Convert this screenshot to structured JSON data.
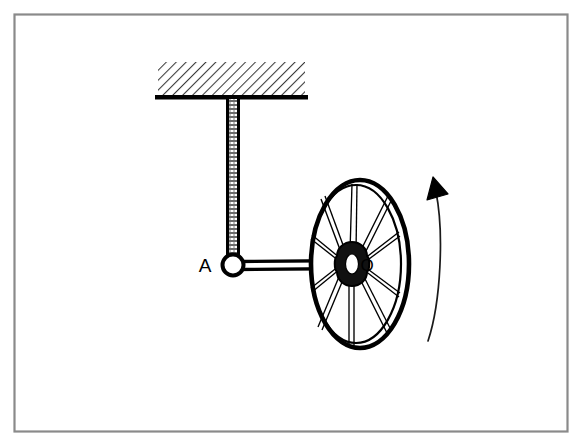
{
  "figure": {
    "background_color": "#ffffff",
    "ink_color": "#000000",
    "frame_color": "#8a8a8a"
  },
  "labels": {
    "joint_a": "A",
    "wheel_center_o": "O"
  },
  "frame": {
    "x": 14,
    "y": 14,
    "width": 554,
    "height": 418
  },
  "ceiling": {
    "name": "hatched-ceiling-support",
    "x": 158,
    "y": 62,
    "width": 147,
    "height": 34,
    "hatch_angle_deg": 45,
    "baseline_y": 97,
    "baseline_x": 155,
    "baseline_width": 153,
    "baseline_thickness": 4
  },
  "vertical_rod": {
    "name": "vertical-hanger-rod",
    "x": 226,
    "y_top": 98,
    "y_bottom": 260,
    "width": 13
  },
  "joint_a": {
    "name": "pin-joint-a",
    "cx": 233,
    "cy": 265,
    "radius": 10,
    "stroke_width": 4,
    "label_x": 205,
    "label_y": 271,
    "label_font_size": 19
  },
  "connecting_arm": {
    "name": "horizontal-connecting-arm",
    "x_start": 238,
    "x_end": 356,
    "y_center": 265,
    "thickness": 9
  },
  "wheel": {
    "name": "rotating-wheel",
    "cx": 360,
    "cy": 264,
    "rx": 50,
    "ry": 84,
    "rim_outer_stroke": 4.5,
    "rim_inner_rx": 44,
    "rim_inner_ry": 77,
    "rim_inner_stroke": 2,
    "spoke_count": 10,
    "spoke_hub_radius_x": 9,
    "spoke_hub_radius_y": 12,
    "hub_rx": 15,
    "hub_ry": 21,
    "hub_bore_rx": 6,
    "hub_bore_ry": 9,
    "hub_cx": 352,
    "hub_cy": 263,
    "label_o_x": 366,
    "label_o_y": 270,
    "label_o_font_size": 16
  },
  "rotation_arrow": {
    "name": "rotation-direction-arrow",
    "path": "M 428 340 C 442 300 444 230 436 190",
    "stroke_width": 1.6,
    "head_points": "436,180 426,200 448,197",
    "direction": "counterclockwise-upward"
  }
}
